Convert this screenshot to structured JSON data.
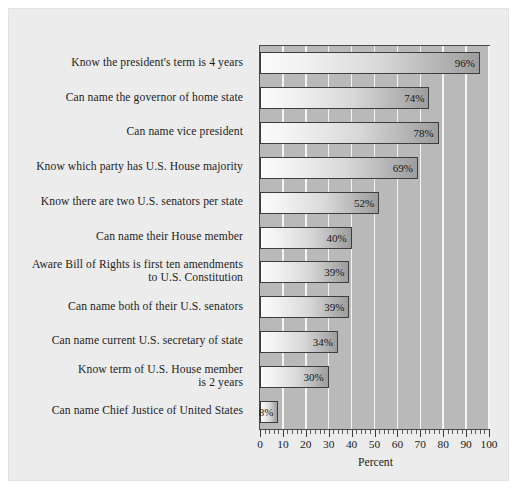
{
  "chart_data": {
    "type": "bar",
    "orientation": "horizontal",
    "title": "",
    "xlabel": "Percent",
    "ylabel": "",
    "xlim": [
      0,
      100
    ],
    "xticks": [
      0,
      10,
      20,
      30,
      40,
      50,
      60,
      70,
      80,
      90,
      100
    ],
    "minor_tick_step": 2,
    "grid": "vertical-white-gridlines",
    "legend": "none",
    "value_label_suffix": "%",
    "categories": [
      "Know the president's term is 4 years",
      "Can name the governor of home state",
      "Can name vice president",
      "Know which party has U.S. House majority",
      "Know there are two U.S. senators per state",
      "Can name their House member",
      "Aware Bill of Rights is first ten amendments to U.S. Constitution",
      "Can name both of their U.S. senators",
      "Can name current U.S. secretary of state",
      "Know term of U.S. House member is 2 years",
      "Can name Chief Justice of United States"
    ],
    "category_lines": [
      [
        "Know the president's term is 4 years"
      ],
      [
        "Can name the governor of home state"
      ],
      [
        "Can name vice president"
      ],
      [
        "Know which party has U.S. House majority"
      ],
      [
        "Know there are two U.S. senators per state"
      ],
      [
        "Can name their House member"
      ],
      [
        "Aware Bill of Rights is first ten amendments",
        "to U.S. Constitution"
      ],
      [
        "Can name both of their U.S. senators"
      ],
      [
        "Can name current U.S. secretary of state"
      ],
      [
        "Know term of U.S. House member",
        "is 2 years"
      ],
      [
        "Can name Chief Justice of United States"
      ]
    ],
    "values": [
      96,
      74,
      78,
      69,
      52,
      40,
      39,
      39,
      34,
      30,
      8
    ],
    "value_labels": [
      "96%",
      "74%",
      "78%",
      "69%",
      "52%",
      "40%",
      "39%",
      "39%",
      "34%",
      "30%",
      "8%"
    ]
  },
  "style": {
    "figure_background": "#ececed",
    "plot_background": "#b9b9b9",
    "gridline_color": "#f4f4f4",
    "bar_border_color": "#3d3d3d",
    "bar_gradient_start": "#fbfbfb",
    "bar_gradient_end": "#9d9d9d",
    "text_color": "#1c1c1c"
  }
}
